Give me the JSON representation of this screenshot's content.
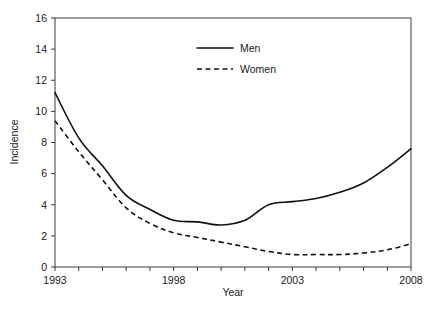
{
  "chart_data": {
    "type": "line",
    "title": "",
    "xlabel": "Year",
    "ylabel": "Incidence",
    "x": [
      1993,
      1994,
      1995,
      1996,
      1997,
      1998,
      1999,
      2000,
      2001,
      2002,
      2003,
      2004,
      2005,
      2006,
      2007,
      2008
    ],
    "xlim": [
      1993,
      2008
    ],
    "ylim": [
      0,
      16
    ],
    "xticks": [
      1993,
      1994,
      1995,
      1996,
      1997,
      1998,
      1999,
      2000,
      2001,
      2002,
      2003,
      2004,
      2005,
      2006,
      2007,
      2008
    ],
    "xtick_labels": [
      "1993",
      "",
      "",
      "",
      "",
      "1998",
      "",
      "",
      "",
      "",
      "2003",
      "",
      "",
      "",
      "",
      "2008"
    ],
    "yticks": [
      0,
      2,
      4,
      6,
      8,
      10,
      12,
      14,
      16
    ],
    "ytick_labels": [
      "0",
      "2",
      "4",
      "6",
      "8",
      "10",
      "12",
      "14",
      "16"
    ],
    "grid": false,
    "legend_position": "top-center",
    "series": [
      {
        "name": "Men",
        "style": "solid",
        "color": "#111111",
        "values": [
          11.2,
          8.3,
          6.5,
          4.6,
          3.7,
          3.0,
          2.9,
          2.7,
          3.0,
          4.0,
          4.2,
          4.4,
          4.8,
          5.4,
          6.4,
          7.6
        ]
      },
      {
        "name": "Women",
        "style": "dashed",
        "color": "#111111",
        "values": [
          9.4,
          7.4,
          5.6,
          3.8,
          2.8,
          2.2,
          1.9,
          1.6,
          1.3,
          1.0,
          0.8,
          0.8,
          0.8,
          0.9,
          1.1,
          1.5
        ]
      }
    ]
  },
  "legend": {
    "men_label": "Men",
    "women_label": "Women"
  },
  "axes": {
    "x_title": "Year",
    "y_title": "Incidence"
  }
}
